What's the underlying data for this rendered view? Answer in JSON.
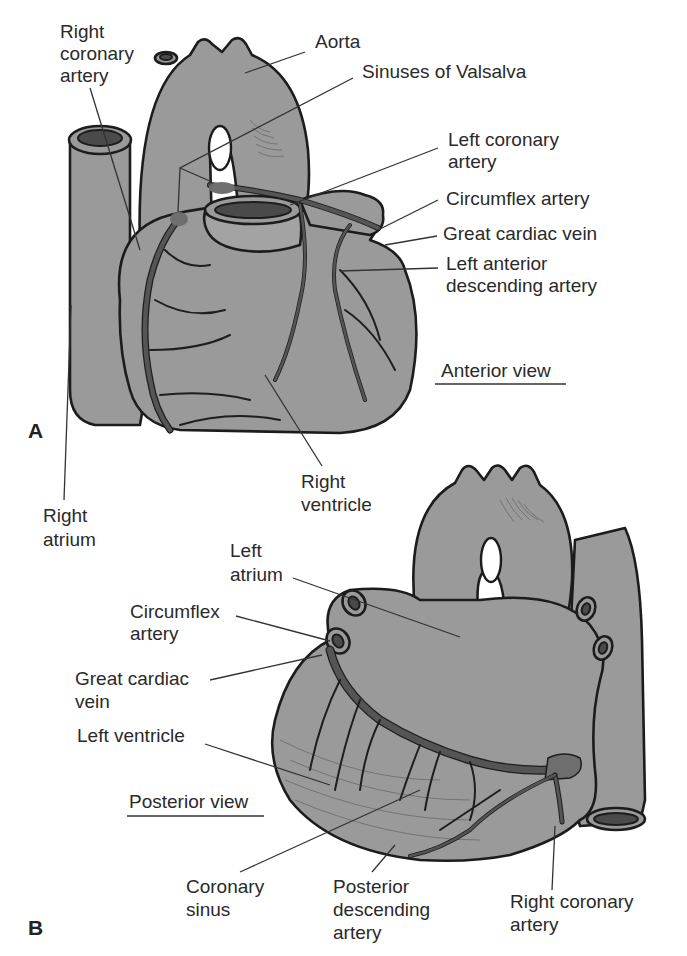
{
  "figure": {
    "panel_a": {
      "letter": "A",
      "view_title": "Anterior view",
      "labels": {
        "right_coronary_artery": [
          "Right",
          "coronary",
          "artery"
        ],
        "aorta": [
          "Aorta"
        ],
        "sinuses_of_valsalva": [
          "Sinuses of Valsalva"
        ],
        "left_coronary_artery": [
          "Left coronary",
          "artery"
        ],
        "circumflex_artery": [
          "Circumflex artery"
        ],
        "great_cardiac_vein": [
          "Great cardiac vein"
        ],
        "left_anterior_descending_artery": [
          "Left anterior",
          "descending artery"
        ],
        "right_ventricle": [
          "Right",
          "ventricle"
        ],
        "right_atrium": [
          "Right",
          "atrium"
        ]
      }
    },
    "panel_b": {
      "letter": "B",
      "view_title": "Posterior view",
      "labels": {
        "left_atrium": [
          "Left",
          "atrium"
        ],
        "circumflex_artery": [
          "Circumflex",
          "artery"
        ],
        "great_cardiac_vein": [
          "Great cardiac",
          "vein"
        ],
        "left_ventricle": [
          "Left ventricle"
        ],
        "coronary_sinus": [
          "Coronary",
          "sinus"
        ],
        "posterior_descending_artery": [
          "Posterior",
          "descending",
          "artery"
        ],
        "right_coronary_artery": [
          "Right coronary",
          "artery"
        ]
      }
    }
  }
}
